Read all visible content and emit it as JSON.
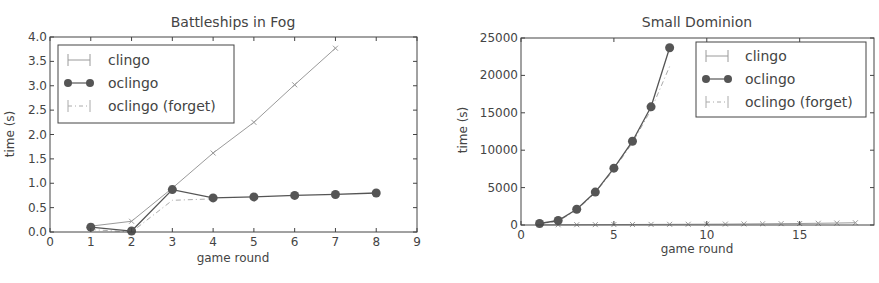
{
  "chart_data": [
    {
      "type": "line",
      "title": "Battleships in Fog",
      "xlabel": "game round",
      "ylabel": "time (s)",
      "xlim": [
        0,
        9
      ],
      "ylim": [
        0,
        4.0
      ],
      "xticks": [
        0,
        1,
        2,
        3,
        4,
        5,
        6,
        7,
        8,
        9
      ],
      "yticks": [
        "0.0",
        "0.5",
        "1.0",
        "1.5",
        "2.0",
        "2.5",
        "3.0",
        "3.5",
        "4.0"
      ],
      "grid": false,
      "legend_position": "upper left",
      "series": [
        {
          "name": "clingo",
          "style": "solid",
          "marker": "x",
          "color": "#9a9a9a",
          "x": [
            1,
            2,
            3,
            4,
            5,
            6,
            7
          ],
          "values": [
            0.12,
            0.22,
            0.9,
            1.62,
            2.25,
            3.02,
            3.77
          ]
        },
        {
          "name": "oclingo",
          "style": "solid",
          "marker": "o",
          "color": "#555555",
          "x": [
            1,
            2,
            3,
            4,
            5,
            6,
            7,
            8
          ],
          "values": [
            0.1,
            0.02,
            0.87,
            0.7,
            0.72,
            0.75,
            0.77,
            0.8
          ]
        },
        {
          "name": "oclingo (forget)",
          "style": "dashdot",
          "marker": "none",
          "color": "#aaaaaa",
          "x": [
            1,
            2,
            3,
            4
          ],
          "values": [
            0.05,
            0.0,
            0.65,
            0.68
          ]
        }
      ]
    },
    {
      "type": "line",
      "title": "Small Dominion",
      "xlabel": "game round",
      "ylabel": "time (s)",
      "xlim": [
        0,
        19
      ],
      "ylim": [
        0,
        25000
      ],
      "xticks": [
        0,
        5,
        10,
        15
      ],
      "yticks": [
        "0",
        "5000",
        "10000",
        "15000",
        "20000",
        "25000"
      ],
      "grid": false,
      "legend_position": "upper right",
      "series": [
        {
          "name": "clingo",
          "style": "solid",
          "marker": "x",
          "color": "#9a9a9a",
          "x": [
            1,
            2,
            3,
            4,
            5,
            6,
            7,
            8,
            9,
            10,
            11,
            12,
            13,
            14,
            15,
            16,
            17,
            18
          ],
          "values": [
            20,
            30,
            40,
            50,
            60,
            70,
            80,
            90,
            100,
            110,
            120,
            140,
            160,
            180,
            200,
            230,
            260,
            300
          ]
        },
        {
          "name": "oclingo",
          "style": "solid",
          "marker": "o",
          "color": "#555555",
          "x": [
            1,
            2,
            3,
            4,
            5,
            6,
            7,
            8
          ],
          "values": [
            200,
            600,
            2100,
            4400,
            7600,
            11200,
            15800,
            23700
          ]
        },
        {
          "name": "oclingo (forget)",
          "style": "dashdot",
          "marker": "none",
          "color": "#aaaaaa",
          "x": [
            1,
            2,
            3,
            4,
            5,
            6,
            7,
            8
          ],
          "values": [
            150,
            500,
            2000,
            4300,
            7400,
            11000,
            15400,
            21200
          ]
        }
      ]
    }
  ],
  "charts": [
    {
      "title": "Battleships in Fog",
      "xlabel": "game round",
      "ylabel": "time (s)",
      "legend": [
        "clingo",
        "oclingo",
        "oclingo (forget)"
      ]
    },
    {
      "title": "Small Dominion",
      "xlabel": "game round",
      "ylabel": "time (s)",
      "legend": [
        "clingo",
        "oclingo",
        "oclingo (forget)"
      ]
    }
  ]
}
